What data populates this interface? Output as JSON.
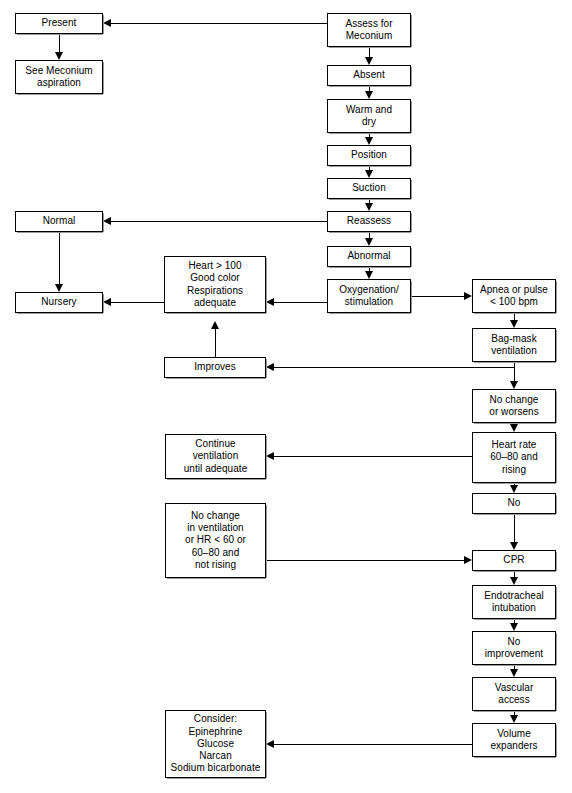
{
  "figure": {
    "bottom_artifact": ""
  },
  "nodes": {
    "present": "Present",
    "see_meconium_aspiration": "See Meconium\naspiration",
    "assess_for_meconium": "Assess for\nMeconium",
    "absent": "Absent",
    "warm_and_dry": "Warm and\ndry",
    "position": "Position",
    "suction": "Suction",
    "reassess": "Reassess",
    "normal": "Normal",
    "abnormal": "Abnormal",
    "nursery": "Nursery",
    "heart_good_color": "Heart > 100\nGood color\nRespirations\nadequate",
    "oxygenation_stimulation": "Oxygenation/\nstimulation",
    "apnea_or_pulse": "Apnea or pulse\n< 100 bpm",
    "bag_mask_ventilation": "Bag-mask\nventilation",
    "improves": "Improves",
    "no_change_or_worsens": "No change\nor worsens",
    "continue_ventilation": "Continue\nventilation\nuntil adequate",
    "heart_rate_60_80": "Heart rate\n60–80 and\nrising",
    "no": "No",
    "no_change_in_ventilation": "No change\nin ventilation\nor HR < 60 or\n60–80 and\nnot rising",
    "cpr": "CPR",
    "endotracheal_intubation": "Endotracheal\nintubation",
    "no_improvement": "No\nimprovement",
    "vascular_access": "Vascular\naccess",
    "volume_expanders": "Volume\nexpanders",
    "consider_meds": "Consider:\nEpinephrine\nGlucose\nNarcan\nSodium bicarbonate"
  },
  "colors": {
    "stroke": "#000000",
    "fill": "#ffffff",
    "text": "#000000"
  }
}
